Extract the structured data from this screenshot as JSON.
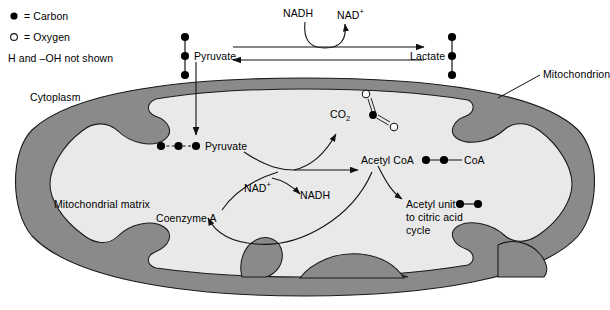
{
  "figure": {
    "canvas": {
      "width": 610,
      "height": 310
    },
    "colors": {
      "membrane_fill": "#8a8a8a",
      "matrix_fill": "#e9e9e9",
      "outline": "#1a1a1a",
      "text": "#000000",
      "carbon_fill": "#000000",
      "oxygen_fill": "#ffffff"
    }
  },
  "legend": {
    "items": [
      {
        "symbol": "filled-circle",
        "text": "= Carbon"
      },
      {
        "symbol": "open-circle",
        "text": "= Oxygen"
      },
      {
        "symbol": "none",
        "text": "H and –OH not shown"
      }
    ]
  },
  "labels": {
    "cytoplasm": "Cytoplasm",
    "mitochondrion": "Mitochondrion",
    "mitochondrial_matrix": "Mitochondrial matrix",
    "pyruvate_outer": "Pyruvate",
    "pyruvate_inner": "Pyruvate",
    "lactate": "Lactate",
    "nadh_top": "NADH",
    "nad_plus_top": "NAD",
    "nad_plus_top_sup": "+",
    "nad_plus_mid": "NAD",
    "nad_plus_mid_sup": "+",
    "nadh_mid": "NADH",
    "co2": "CO",
    "co2_sub": "2",
    "acetyl_coa": "Acetyl CoA",
    "coa_tag": "CoA",
    "coenzyme_a": "Coenzyme A",
    "acetyl_unit_line1": "Acetyl unit",
    "acetyl_unit_line2": "to citric acid",
    "acetyl_unit_line3": "cycle"
  },
  "molecules": [
    {
      "name": "pyruvate-cytoplasm",
      "orientation": "vertical",
      "atoms": [
        "C",
        "C",
        "C"
      ],
      "bonds": "solid",
      "carbon_count": 3
    },
    {
      "name": "lactate",
      "orientation": "vertical",
      "atoms": [
        "C",
        "C",
        "C"
      ],
      "bonds": "solid",
      "carbon_count": 3
    },
    {
      "name": "pyruvate-matrix",
      "orientation": "horizontal",
      "atoms": [
        "C",
        "C",
        "C"
      ],
      "bonds": "dashed",
      "carbon_count": 3
    },
    {
      "name": "carbon-dioxide",
      "orientation": "bent",
      "atoms": [
        "O",
        "C",
        "O"
      ],
      "bonds": "double",
      "carbon_count": 1,
      "oxygen_count": 2
    },
    {
      "name": "acetyl-coa",
      "orientation": "horizontal",
      "atoms": [
        "C",
        "C",
        "CoA"
      ],
      "bonds": "solid",
      "carbon_count": 2
    },
    {
      "name": "acetyl-unit",
      "orientation": "horizontal",
      "atoms": [
        "C",
        "C"
      ],
      "bonds": "solid",
      "carbon_count": 2
    }
  ],
  "reactions": [
    {
      "name": "pyruvate-to-lactate",
      "direction": "right",
      "style": "straight"
    },
    {
      "name": "lactate-to-pyruvate",
      "direction": "left",
      "style": "straight"
    },
    {
      "name": "nadh-to-nad-plus",
      "direction": "right",
      "style": "curved-u"
    },
    {
      "name": "pyruvate-transport",
      "direction": "down",
      "style": "straight"
    },
    {
      "name": "pyruvate-to-acetyl-coa",
      "direction": "right",
      "style": "straight"
    },
    {
      "name": "release-co2",
      "direction": "up",
      "style": "curved"
    },
    {
      "name": "nad-plus-to-nadh",
      "direction": "down-right",
      "style": "curved"
    },
    {
      "name": "coenzyme-a-input",
      "direction": "up-right",
      "style": "curved"
    },
    {
      "name": "coa-recycle",
      "direction": "left",
      "style": "curved"
    },
    {
      "name": "acetyl-coa-to-citric-acid-cycle",
      "direction": "down-right",
      "style": "curved"
    }
  ]
}
